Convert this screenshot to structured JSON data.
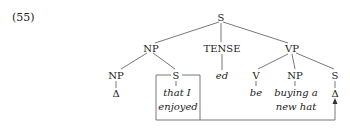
{
  "example_number": "(55)",
  "tree": {
    "root": "S",
    "level1": {
      "np": "NP",
      "tense": "TENSE",
      "vp": "VP"
    },
    "np_children": {
      "np": "NP",
      "np_leaf": "Δ",
      "s": "S",
      "s_leaf_line1": "that I",
      "s_leaf_line2": "enjoyed"
    },
    "tense_leaf": "ed",
    "vp_children": {
      "v": "V",
      "v_leaf": "be",
      "np": "NP",
      "np_leaf_line1": "buying a",
      "np_leaf_line2": "new hat",
      "s": "S",
      "s_leaf": "Δ"
    }
  },
  "annotation": {
    "movement": "boxed S moved to VP-final S position (arrow)"
  },
  "colors": {
    "ink": "#222222",
    "line": "#555555",
    "background": "#ffffff"
  }
}
